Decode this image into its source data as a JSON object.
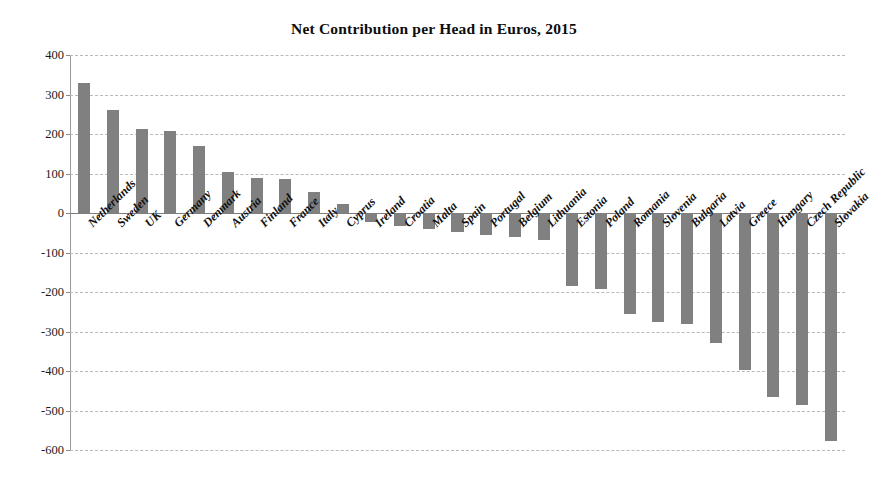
{
  "chart_data": {
    "type": "bar",
    "title": "Net Contribution per Head in Euros, 2015",
    "xlabel": "",
    "ylabel": "",
    "ylim": [
      -600,
      400
    ],
    "ytick_step": 100,
    "yticks": [
      400,
      300,
      200,
      100,
      0,
      -100,
      -200,
      -300,
      -400,
      -500,
      -600
    ],
    "ytick_labels": [
      "400",
      "300",
      "200",
      "100",
      "0",
      "-100",
      "-200",
      "-300",
      "-400",
      "-500",
      "-600"
    ],
    "grid": true,
    "legend": false,
    "legend_position": "none",
    "bar_color": "#808080",
    "categories": [
      "Netherlands",
      "Sweden",
      "UK",
      "Germany",
      "Denmark",
      "Austria",
      "Finland",
      "France",
      "Italy",
      "Cyprus",
      "Ireland",
      "Croatia",
      "Malta",
      "Spain",
      "Portugal",
      "Belgium",
      "Lithuania",
      "Estonia",
      "Poland",
      "Romania",
      "Slovenia",
      "Bulgaria",
      "Latvia",
      "Greece",
      "Hungary",
      "Czech Republic",
      "Slovakia"
    ],
    "values": [
      330,
      261,
      213,
      208,
      169,
      104,
      89,
      85,
      53,
      24,
      -24,
      -32,
      -40,
      -47,
      -55,
      -60,
      -68,
      -185,
      -193,
      -255,
      -275,
      -282,
      -330,
      -398,
      -465,
      -485,
      -578
    ]
  }
}
